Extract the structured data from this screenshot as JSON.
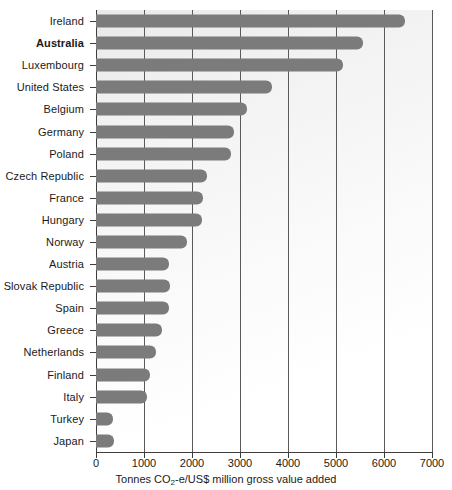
{
  "chart_data": {
    "type": "bar",
    "orientation": "horizontal",
    "title": "",
    "xlabel": "Tonnes CO2-e/US$ million gross value added",
    "xlabel_parts": {
      "before": "Tonnes CO",
      "sub": "2",
      "after": "-e/US$ million gross value added"
    },
    "ylabel": "",
    "xlim": [
      0,
      7000
    ],
    "xticks": [
      0,
      1000,
      2000,
      3000,
      4000,
      5000,
      6000,
      7000
    ],
    "xtick_labels": [
      "0",
      "1000",
      "2000",
      "3000",
      "4000",
      "5000",
      "6000",
      "7000"
    ],
    "grid": "vertical",
    "legend": "none",
    "bar_color": "#7b7b7b",
    "highlight_category": "Australia",
    "categories": [
      "Ireland",
      "Australia",
      "Luxembourg",
      "United States",
      "Belgium",
      "Germany",
      "Poland",
      "Czech Republic",
      "France",
      "Hungary",
      "Norway",
      "Austria",
      "Slovak Republic",
      "Spain",
      "Greece",
      "Netherlands",
      "Finland",
      "Italy",
      "Turkey",
      "Japan"
    ],
    "values": [
      6440,
      5560,
      5140,
      3670,
      3150,
      2880,
      2810,
      2320,
      2230,
      2200,
      1900,
      1530,
      1540,
      1520,
      1380,
      1250,
      1130,
      1070,
      360,
      380
    ],
    "bars": [
      {
        "label": "Ireland",
        "value": 6440,
        "bold": false
      },
      {
        "label": "Australia",
        "value": 5560,
        "bold": true
      },
      {
        "label": "Luxembourg",
        "value": 5140,
        "bold": false
      },
      {
        "label": "United States",
        "value": 3670,
        "bold": false
      },
      {
        "label": "Belgium",
        "value": 3150,
        "bold": false
      },
      {
        "label": "Germany",
        "value": 2880,
        "bold": false
      },
      {
        "label": "Poland",
        "value": 2810,
        "bold": false
      },
      {
        "label": "Czech Republic",
        "value": 2320,
        "bold": false
      },
      {
        "label": "France",
        "value": 2230,
        "bold": false
      },
      {
        "label": "Hungary",
        "value": 2200,
        "bold": false
      },
      {
        "label": "Norway",
        "value": 1900,
        "bold": false
      },
      {
        "label": "Austria",
        "value": 1530,
        "bold": false
      },
      {
        "label": "Slovak Republic",
        "value": 1540,
        "bold": false
      },
      {
        "label": "Spain",
        "value": 1520,
        "bold": false
      },
      {
        "label": "Greece",
        "value": 1380,
        "bold": false
      },
      {
        "label": "Netherlands",
        "value": 1250,
        "bold": false
      },
      {
        "label": "Finland",
        "value": 1130,
        "bold": false
      },
      {
        "label": "Italy",
        "value": 1070,
        "bold": false
      },
      {
        "label": "Turkey",
        "value": 360,
        "bold": false
      },
      {
        "label": "Japan",
        "value": 380,
        "bold": false
      }
    ]
  }
}
